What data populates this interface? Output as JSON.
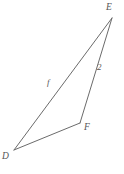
{
  "figure": {
    "name": "triangle-def",
    "type": "geometry-diagram",
    "background_color": "#ffffff",
    "stroke_color": "#6b6b6b",
    "text_color": "#555555",
    "stroke_width": 1,
    "vertices": [
      {
        "id": "D",
        "label": "D",
        "x": 14,
        "y": 150
      },
      {
        "id": "E",
        "label": "E",
        "x": 112,
        "y": 18
      },
      {
        "id": "F",
        "label": "F",
        "x": 80,
        "y": 123
      }
    ],
    "sides": [
      {
        "id": "DE",
        "from": "D",
        "to": "E",
        "label": "f"
      },
      {
        "id": "EF",
        "from": "E",
        "to": "F",
        "label": "2"
      },
      {
        "id": "FD",
        "from": "F",
        "to": "D",
        "label": ""
      }
    ],
    "labels": {
      "vertex_E": "E",
      "vertex_D": "D",
      "vertex_F": "F",
      "side_DE": "f",
      "side_EF": "2"
    }
  }
}
